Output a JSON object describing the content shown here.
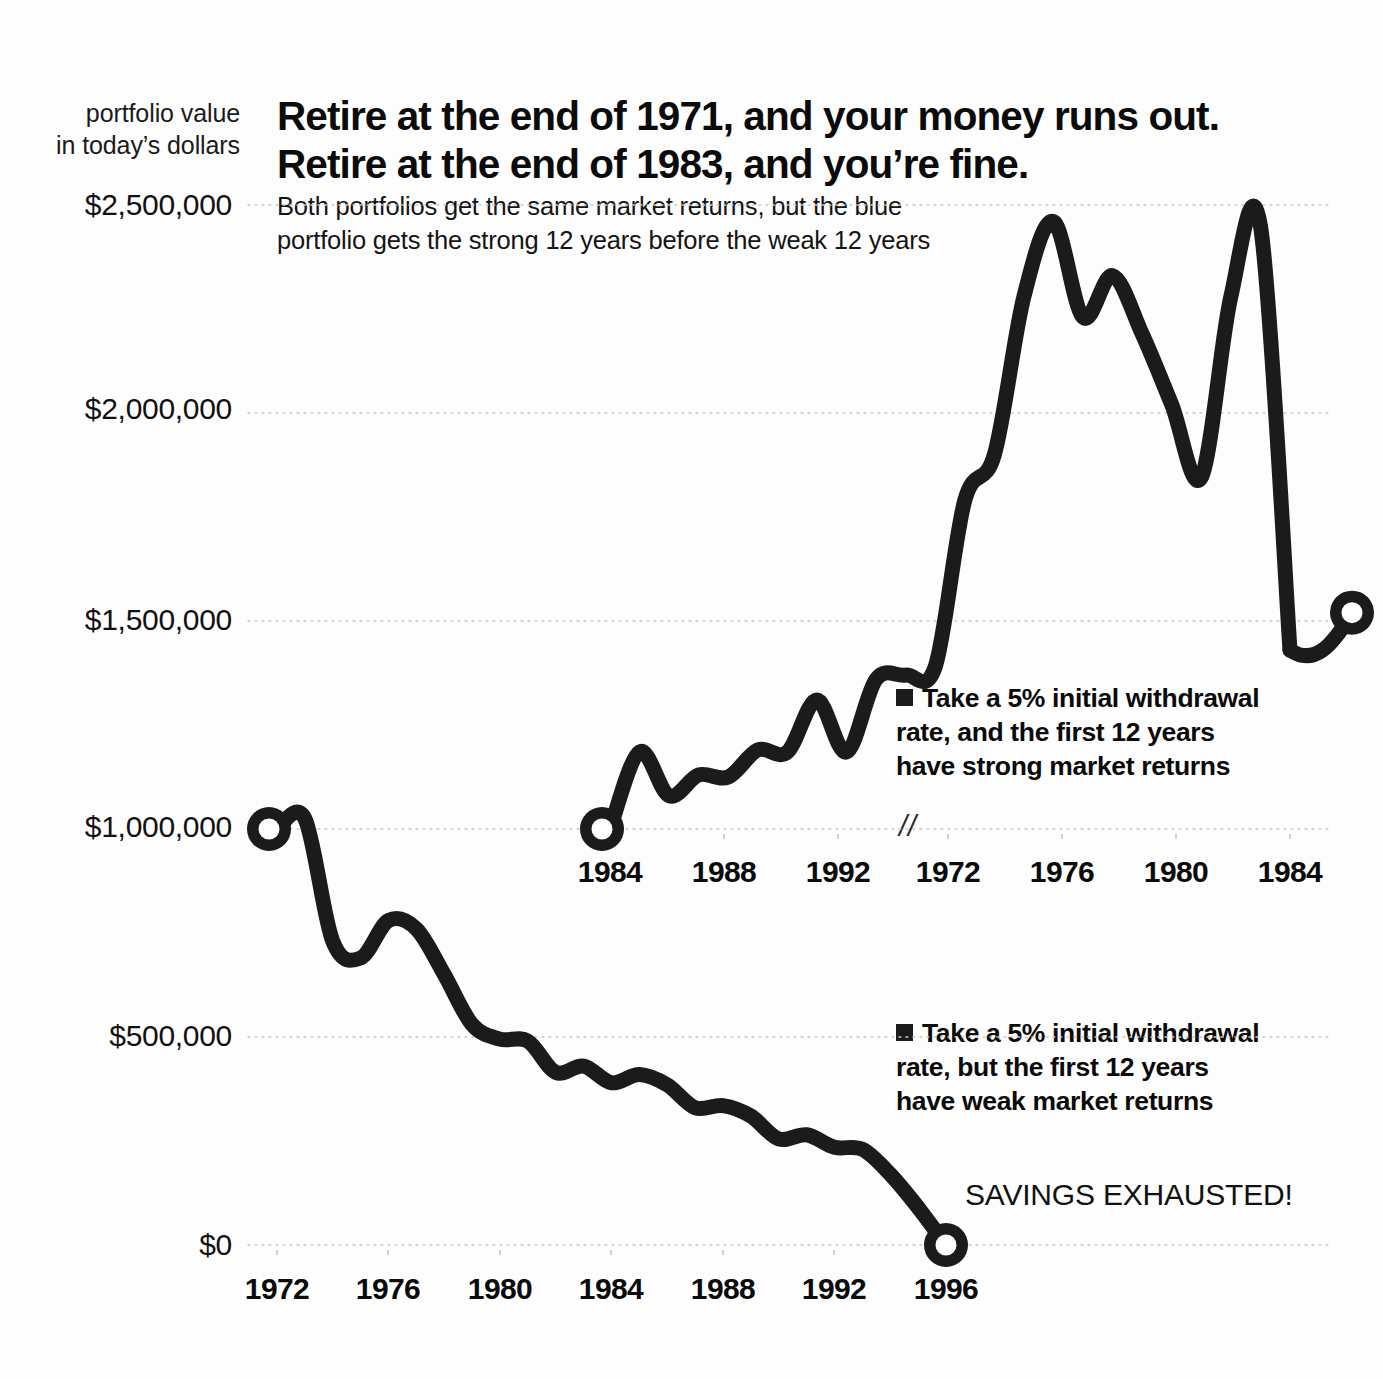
{
  "meta": {
    "y_axis_caption_line1": "portfolio value",
    "y_axis_caption_line2": "in today’s dollars",
    "headline_line1": "Retire at the end of 1971, and your money runs out.",
    "headline_line2": "Retire at the end of 1983, and you’re fine.",
    "subhead_line1": "Both portfolios get the same market returns, but the blue",
    "subhead_line2": "portfolio gets the strong 12 years before the weak 12 years",
    "axis_break_symbol": "//",
    "annotation_savings_exhausted": "SAVINGS EXHAUSTED!",
    "colors": {
      "line": "#1b1b1b",
      "background": "#fdfdfd",
      "gridline": "#c9c9c9",
      "text": "#0b0b0b"
    }
  },
  "legend": {
    "strong": {
      "line1": "Take a 5% initial withdrawal",
      "line2": "rate, and the first 12 years",
      "line3": "have strong market returns"
    },
    "weak": {
      "line1": "Take a 5% initial withdrawal",
      "line2": "rate, but the first 12 years",
      "line3": "have weak market returns"
    }
  },
  "chart_data": {
    "type": "line",
    "title": "Retire at the end of 1971, and your money runs out. Retire at the end of 1983, and you’re fine.",
    "subtitle": "Both portfolios get the same market returns, but the blue portfolio gets the strong 12 years before the weak 12 years",
    "ylabel": "portfolio value in today’s dollars",
    "xlabel": "",
    "ylim": [
      0,
      2500000
    ],
    "grid": true,
    "legend_position": "inside-right",
    "y_ticks": [
      {
        "value": 2500000,
        "label": "$2,500,000"
      },
      {
        "value": 2000000,
        "label": "$2,000,000"
      },
      {
        "value": 1500000,
        "label": "$1,500,000"
      },
      {
        "value": 1000000,
        "label": "$1,000,000"
      },
      {
        "value": 500000,
        "label": "$500,000"
      },
      {
        "value": 0,
        "label": "$0"
      }
    ],
    "axes": [
      {
        "name": "upper-axis-strong-first",
        "note": "axis is broken between 1992 and 1972; years 1984-1995 then 1972-1983",
        "tick_labels": [
          "1984",
          "1988",
          "1992",
          "1972",
          "1976",
          "1980",
          "1984"
        ],
        "break_after_label": "1992"
      },
      {
        "name": "lower-axis-weak-first",
        "tick_labels": [
          "1972",
          "1976",
          "1980",
          "1984",
          "1988",
          "1992",
          "1996"
        ]
      }
    ],
    "series": [
      {
        "name": "Take a 5% initial withdrawal rate, and the first 12 years have strong market returns",
        "short_name": "strong-first",
        "axis": "upper-axis-strong-first",
        "start_marker": {
          "label": "1984",
          "value": 1000000
        },
        "end_marker": {
          "label": "1984",
          "value": 1520000
        },
        "x": [
          "1984",
          "1985",
          "1986",
          "1987",
          "1988",
          "1989",
          "1990",
          "1991",
          "1992",
          "1993",
          "1994",
          "1995",
          "1972",
          "1973",
          "1974",
          "1975",
          "1976",
          "1977",
          "1978",
          "1979",
          "1980",
          "1981",
          "1982",
          "1983"
        ],
        "values": [
          1000000,
          1185000,
          1080000,
          1130000,
          1125000,
          1190000,
          1185000,
          1310000,
          1185000,
          1360000,
          1370000,
          1390000,
          1790000,
          1900000,
          2280000,
          2460000,
          2230000,
          2330000,
          2190000,
          2020000,
          1845000,
          2280000,
          2450000,
          1430000
        ]
      },
      {
        "name": "Take a 5% initial withdrawal rate, but the first 12 years have weak market returns",
        "short_name": "weak-first",
        "axis": "lower-axis-weak-first",
        "start_marker": {
          "label": "1972",
          "value": 1000000
        },
        "end_marker": {
          "label": "1996",
          "value": 0
        },
        "x": [
          "1972",
          "1973",
          "1974",
          "1975",
          "1976",
          "1977",
          "1978",
          "1979",
          "1980",
          "1981",
          "1982",
          "1983",
          "1984",
          "1985",
          "1986",
          "1987",
          "1988",
          "1989",
          "1990",
          "1991",
          "1992",
          "1993",
          "1994",
          "1995",
          "1996"
        ],
        "values": [
          1000000,
          1025000,
          730000,
          690000,
          780000,
          760000,
          650000,
          530000,
          495000,
          490000,
          415000,
          430000,
          390000,
          410000,
          385000,
          330000,
          335000,
          310000,
          255000,
          265000,
          235000,
          230000,
          170000,
          90000,
          0
        ]
      }
    ]
  },
  "y_axis_labels": [
    "$2,500,000",
    "$2,000,000",
    "$1,500,000",
    "$1,000,000",
    "$500,000",
    "$0"
  ],
  "upper_x_labels": [
    "1984",
    "1988",
    "1992",
    "1972",
    "1976",
    "1980",
    "1984"
  ],
  "lower_x_labels": [
    "1972",
    "1976",
    "1980",
    "1984",
    "1988",
    "1992",
    "1996"
  ]
}
